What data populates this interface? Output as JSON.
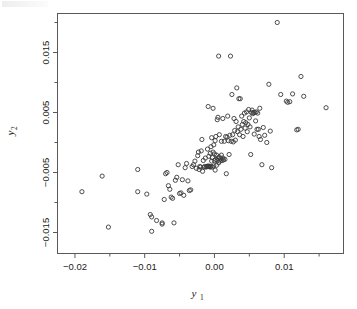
{
  "figure": {
    "background_color": "#ffffff",
    "marker_color": "#3a3a3a",
    "axis_color": "#595959"
  },
  "chart_data": {
    "type": "scatter",
    "title": "",
    "subtitle": "",
    "xlabel": "y1",
    "ylabel": "y2",
    "xlabel_base": "y",
    "xlabel_sub": "1",
    "ylabel_base": "y",
    "ylabel_sub": "2",
    "grid": false,
    "legend": false,
    "legend_position": "none",
    "marker": "open-circle",
    "marker_size_px": 4.2,
    "xlim": [
      -0.0225,
      0.0185
    ],
    "ylim": [
      -0.0185,
      0.0215
    ],
    "xticks": [
      -0.02,
      -0.01,
      0.0,
      0.01
    ],
    "xtick_labels": [
      "-0.02",
      "-0.01",
      "0.00",
      "0.01"
    ],
    "xminor_ticks": [
      -0.015,
      -0.005,
      0.005,
      0.015
    ],
    "yticks": [
      -0.015,
      -0.005,
      0.005,
      0.015
    ],
    "ytick_labels": [
      "-0.015",
      "-0.005",
      "0.005",
      "0.015"
    ],
    "yminor_ticks": [
      -0.01,
      0.0,
      0.01,
      0.02
    ],
    "n_points": 140,
    "points": [
      [
        -0.019,
        -0.0082
      ],
      [
        -0.0161,
        -0.0056
      ],
      [
        -0.0152,
        -0.0141
      ],
      [
        -0.011,
        -0.0045
      ],
      [
        -0.011,
        -0.0082
      ],
      [
        -0.0097,
        -0.0086
      ],
      [
        -0.0092,
        -0.012
      ],
      [
        -0.009,
        -0.0124
      ],
      [
        -0.009,
        -0.0148
      ],
      [
        -0.0083,
        -0.013
      ],
      [
        -0.0075,
        -0.0134
      ],
      [
        -0.0075,
        -0.0136
      ],
      [
        -0.0072,
        -0.0095
      ],
      [
        -0.007,
        -0.0052
      ],
      [
        -0.0068,
        -0.005
      ],
      [
        -0.0066,
        -0.0072
      ],
      [
        -0.0064,
        -0.0078
      ],
      [
        -0.0062,
        -0.0091
      ],
      [
        -0.006,
        -0.0093
      ],
      [
        -0.0058,
        -0.0134
      ],
      [
        -0.0056,
        -0.0063
      ],
      [
        -0.0054,
        -0.0058
      ],
      [
        -0.0052,
        -0.0037
      ],
      [
        -0.005,
        -0.0085
      ],
      [
        -0.0048,
        -0.0084
      ],
      [
        -0.0046,
        -0.0062
      ],
      [
        -0.0044,
        -0.0088
      ],
      [
        -0.0042,
        -0.0042
      ],
      [
        -0.004,
        -0.0035
      ],
      [
        -0.0038,
        -0.0064
      ],
      [
        -0.0036,
        -0.008
      ],
      [
        -0.0034,
        -0.0079
      ],
      [
        -0.0032,
        -0.004
      ],
      [
        -0.003,
        -0.0037
      ],
      [
        -0.0028,
        -0.0031
      ],
      [
        -0.0026,
        -0.0043
      ],
      [
        -0.0024,
        -0.0022
      ],
      [
        -0.0023,
        -0.0016
      ],
      [
        -0.0022,
        -0.0045
      ],
      [
        -0.0021,
        -0.004
      ],
      [
        -0.002,
        -0.0041
      ],
      [
        -0.0019,
        -0.0014
      ],
      [
        -0.0018,
        0.0005
      ],
      [
        -0.0017,
        -0.0048
      ],
      [
        -0.0016,
        -0.003
      ],
      [
        -0.0015,
        -0.0041
      ],
      [
        -0.0014,
        -0.004
      ],
      [
        -0.0013,
        -0.0026
      ],
      [
        -0.0012,
        -0.0041
      ],
      [
        -0.0011,
        -0.004
      ],
      [
        -0.001,
        -0.004
      ],
      [
        -0.001,
        -0.0011
      ],
      [
        -0.0009,
        -0.0039
      ],
      [
        -0.0009,
        0.006
      ],
      [
        -0.0008,
        -0.004
      ],
      [
        -0.0008,
        -0.0023
      ],
      [
        -0.0007,
        -0.004
      ],
      [
        -0.0006,
        -0.0041
      ],
      [
        -0.0006,
        -0.0018
      ],
      [
        -0.0005,
        -0.004
      ],
      [
        -0.0005,
        -0.0007
      ],
      [
        -0.0004,
        -0.0031
      ],
      [
        -0.0004,
        0.0008
      ],
      [
        -0.0003,
        -0.0041
      ],
      [
        -0.0003,
        -0.0025
      ],
      [
        -0.0002,
        -0.0016
      ],
      [
        -0.0002,
        0.0057
      ],
      [
        -0.0001,
        -0.0039
      ],
      [
        -0.0001,
        -0.0004
      ],
      [
        0.0,
        -0.003
      ],
      [
        0.0,
        -0.0019
      ],
      [
        0.0001,
        -0.0046
      ],
      [
        0.0001,
        0.0003
      ],
      [
        0.0002,
        -0.0028
      ],
      [
        0.0002,
        0.001
      ],
      [
        0.0003,
        -0.0038
      ],
      [
        0.0003,
        -0.0021
      ],
      [
        0.0004,
        -0.003
      ],
      [
        0.0004,
        0.0038
      ],
      [
        0.0005,
        -0.0026
      ],
      [
        0.0005,
        0.0042
      ],
      [
        0.0006,
        -0.0034
      ],
      [
        0.0006,
        0.0144
      ],
      [
        0.0007,
        -0.0024
      ],
      [
        0.0007,
        0.0013
      ],
      [
        0.0008,
        -0.0031
      ],
      [
        0.0009,
        -0.0027
      ],
      [
        0.001,
        -0.0021
      ],
      [
        0.001,
        0.0002
      ],
      [
        0.0011,
        -0.003
      ],
      [
        0.0012,
        -0.0026
      ],
      [
        0.0012,
        0.004
      ],
      [
        0.0013,
        -0.0029
      ],
      [
        0.0014,
        0.0002
      ],
      [
        0.0015,
        -0.0028
      ],
      [
        0.0016,
        0.001
      ],
      [
        0.0017,
        -0.0052
      ],
      [
        0.0018,
        0.0009
      ],
      [
        0.0019,
        0.0044
      ],
      [
        0.002,
        0.0003
      ],
      [
        0.0021,
        -0.002
      ],
      [
        0.0022,
        0.0012
      ],
      [
        0.0023,
        0.0144
      ],
      [
        0.0024,
        0.0002
      ],
      [
        0.0025,
        0.008
      ],
      [
        0.0026,
        0.0013
      ],
      [
        0.0027,
        0.0001
      ],
      [
        0.0028,
        0.004
      ],
      [
        0.0029,
        0.002
      ],
      [
        0.003,
        0.0004
      ],
      [
        0.0031,
        0.0035
      ],
      [
        0.0032,
        0.0091
      ],
      [
        0.0033,
        0.0018
      ],
      [
        0.0034,
        0.0026
      ],
      [
        0.0035,
        0.0073
      ],
      [
        0.0036,
        0.0013
      ],
      [
        0.0037,
        0.0073
      ],
      [
        0.0038,
        0.0022
      ],
      [
        0.0039,
        0.0044
      ],
      [
        0.004,
        0.003
      ],
      [
        0.0041,
        0.001
      ],
      [
        0.0042,
        0.0035
      ],
      [
        0.0043,
        0.0049
      ],
      [
        0.0044,
        0.0024
      ],
      [
        0.0045,
        0.0033
      ],
      [
        0.0046,
        0.0051
      ],
      [
        0.0047,
        0.0018
      ],
      [
        0.0048,
        0.003
      ],
      [
        0.0049,
        0.0055
      ],
      [
        0.005,
        0.0041
      ],
      [
        0.0051,
        0.0026
      ],
      [
        0.0052,
        -0.002
      ],
      [
        0.0053,
        0.005
      ],
      [
        0.0054,
        0.0054
      ],
      [
        0.0055,
        0.0048
      ],
      [
        0.0056,
        0.005
      ],
      [
        0.0057,
        0.0014
      ],
      [
        0.0058,
        0.005
      ],
      [
        0.0059,
        0.0036
      ],
      [
        0.006,
        0.0051
      ],
      [
        0.0061,
        0.0022
      ],
      [
        0.0062,
        0.0049
      ],
      [
        0.0063,
        0.0022
      ],
      [
        0.0064,
        0.001
      ],
      [
        0.0065,
        0.0057
      ],
      [
        0.0066,
        0.0005
      ],
      [
        0.0068,
        -0.0037
      ],
      [
        0.007,
        0.0025
      ],
      [
        0.0072,
        0.0012
      ],
      [
        0.0075,
        0.0
      ],
      [
        0.0078,
        0.0097
      ],
      [
        0.008,
        0.0019
      ],
      [
        0.0082,
        -0.0042
      ],
      [
        0.009,
        0.02
      ],
      [
        0.0095,
        0.008
      ],
      [
        0.0103,
        0.0069
      ],
      [
        0.0105,
        0.0067
      ],
      [
        0.0108,
        0.0068
      ],
      [
        0.0112,
        0.0081
      ],
      [
        0.0118,
        0.0021
      ],
      [
        0.012,
        0.0022
      ],
      [
        0.0124,
        0.011
      ],
      [
        0.0128,
        0.0077
      ],
      [
        0.016,
        0.0058
      ]
    ]
  }
}
